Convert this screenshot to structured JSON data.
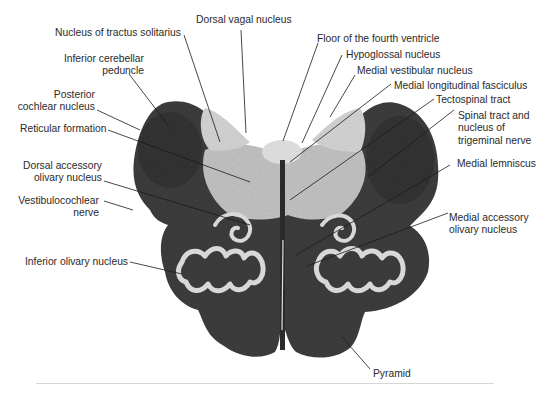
{
  "figure": {
    "colors": {
      "background": "#ffffff",
      "tissue_dark": "#3a3a3a",
      "tissue_light": "#c9c9c9",
      "olive_white": "#d8d8d8",
      "label_text": "#2a2a2a",
      "leader_line": "#1a1a1a"
    }
  },
  "labels": {
    "left": [
      {
        "id": "nucleus-tractus-solitarius",
        "lines": [
          "Nucleus of tractus solitarius"
        ]
      },
      {
        "id": "inferior-cerebellar-peduncle",
        "lines": [
          "Inferior cerebellar",
          "peduncle"
        ]
      },
      {
        "id": "posterior-cochlear-nucleus",
        "lines": [
          "Posterior",
          "cochlear nucleus"
        ]
      },
      {
        "id": "reticular-formation",
        "lines": [
          "Reticular formation"
        ]
      },
      {
        "id": "dorsal-accessory-olivary-nucleus",
        "lines": [
          "Dorsal accessory",
          "olivary nucleus"
        ]
      },
      {
        "id": "vestibulocochlear-nerve",
        "lines": [
          "Vestibulocochlear",
          "nerve"
        ]
      },
      {
        "id": "inferior-olivary-nucleus",
        "lines": [
          "Inferior olivary nucleus"
        ]
      }
    ],
    "top": [
      {
        "id": "dorsal-vagal-nucleus",
        "lines": [
          "Dorsal vagal nucleus"
        ]
      }
    ],
    "right": [
      {
        "id": "floor-fourth-ventricle",
        "lines": [
          "Floor of the fourth ventricle"
        ]
      },
      {
        "id": "hypoglossal-nucleus",
        "lines": [
          "Hypoglossal nucleus"
        ]
      },
      {
        "id": "medial-vestibular-nucleus",
        "lines": [
          "Medial vestibular nucleus"
        ]
      },
      {
        "id": "medial-longitudinal-fasciculus",
        "lines": [
          "Medial longitudinal fasciculus"
        ]
      },
      {
        "id": "tectospinal-tract",
        "lines": [
          "Tectospinal tract"
        ]
      },
      {
        "id": "spinal-tract-trigeminal",
        "lines": [
          "Spinal tract and",
          "nucleus of",
          "trigeminal nerve"
        ]
      },
      {
        "id": "medial-lemniscus",
        "lines": [
          "Medial lemniscus"
        ]
      },
      {
        "id": "medial-accessory-olivary-nucleus",
        "lines": [
          "Medial accessory",
          "olivary nucleus"
        ]
      }
    ],
    "bottom": [
      {
        "id": "pyramid",
        "lines": [
          "Pyramid"
        ]
      }
    ]
  }
}
